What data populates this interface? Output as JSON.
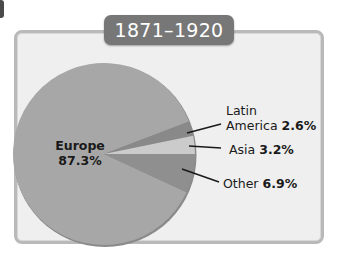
{
  "chart_data": {
    "type": "pie",
    "title": "1871–1920",
    "categories": [
      "Europe",
      "Latin America",
      "Asia",
      "Other"
    ],
    "values": [
      87.3,
      2.6,
      3.2,
      6.9
    ],
    "unit": "%",
    "colors": [
      "#a7a7a7",
      "#898989",
      "#cbcbcb",
      "#8f8f8f"
    ],
    "labels": [
      {
        "name": "Europe",
        "value_text": "87.3%"
      },
      {
        "name_line1": "Latin",
        "name_line2": "America",
        "value_text": "2.6%"
      },
      {
        "name": "Asia",
        "value_text": "3.2%"
      },
      {
        "name": "Other",
        "value_text": "6.9%"
      }
    ],
    "legend": "none (direct labels with leader lines)"
  },
  "title": "1871–1920",
  "labels": {
    "europe_name": "Europe",
    "europe_value": "87.3%",
    "latin_line1": "Latin",
    "latin_name": "America",
    "latin_value": "2.6%",
    "asia_name": "Asia",
    "asia_value": "3.2%",
    "other_name": "Other",
    "other_value": "6.9%"
  }
}
